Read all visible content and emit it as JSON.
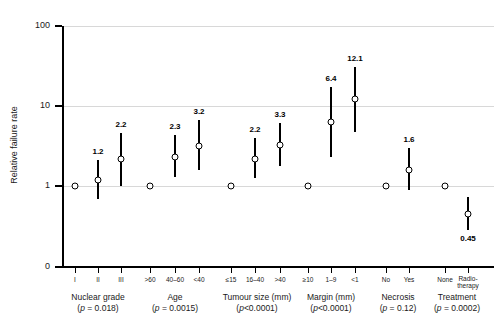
{
  "chart_data": {
    "type": "scatter",
    "title": "",
    "xlabel": "",
    "ylabel": "Relative failure rate",
    "yscale": "log",
    "ylim": [
      0,
      100
    ],
    "ytick_labels": [
      "100",
      "10",
      "1",
      "0"
    ],
    "ytick_values": [
      100,
      10,
      1,
      0
    ],
    "grid": true,
    "gridlines_at": [
      100,
      10,
      1
    ],
    "legend": "none",
    "annotation": "Reference categories plotted at relative failure rate 1.0 with no confidence interval.",
    "groups": [
      {
        "name": "Nuclear grade",
        "pvalue_text": "(p = 0.018)",
        "pvalue": 0.018,
        "points": [
          {
            "label": "I",
            "value": 1.0,
            "value_text": "",
            "ci_low": null,
            "ci_high": null,
            "reference": true
          },
          {
            "label": "II",
            "value": 1.2,
            "value_text": "1.2",
            "ci_low": 0.68,
            "ci_high": 2.1,
            "reference": false
          },
          {
            "label": "III",
            "value": 2.2,
            "value_text": "2.2",
            "ci_low": 1.0,
            "ci_high": 4.6,
            "reference": false
          }
        ]
      },
      {
        "name": "Age",
        "pvalue_text": "(p = 0.0015)",
        "pvalue": 0.0015,
        "points": [
          {
            "label": ">60",
            "value": 1.0,
            "value_text": "",
            "ci_low": null,
            "ci_high": null,
            "reference": true
          },
          {
            "label": "40–60",
            "value": 2.3,
            "value_text": "2.3",
            "ci_low": 1.3,
            "ci_high": 4.3,
            "reference": false
          },
          {
            "label": "<40",
            "value": 3.2,
            "value_text": "3.2",
            "ci_low": 1.6,
            "ci_high": 6.6,
            "reference": false
          }
        ]
      },
      {
        "name": "Tumour size (mm)",
        "pvalue_text": "(p<0.0001)",
        "pvalue": 0.0001,
        "points": [
          {
            "label": "≤15",
            "value": 1.0,
            "value_text": "",
            "ci_low": null,
            "ci_high": null,
            "reference": true
          },
          {
            "label": "16–40",
            "value": 2.2,
            "value_text": "2.2",
            "ci_low": 1.25,
            "ci_high": 4.0,
            "reference": false
          },
          {
            "label": ">40",
            "value": 3.3,
            "value_text": "3.3",
            "ci_low": 1.8,
            "ci_high": 6.2,
            "reference": false
          }
        ]
      },
      {
        "name": "Margin (mm)",
        "pvalue_text": "(p<0.0001)",
        "pvalue": 0.0001,
        "points": [
          {
            "label": "≥10",
            "value": 1.0,
            "value_text": "",
            "ci_low": null,
            "ci_high": null,
            "reference": true
          },
          {
            "label": "1–9",
            "value": 6.4,
            "value_text": "6.4",
            "ci_low": 2.3,
            "ci_high": 17.5,
            "reference": false
          },
          {
            "label": "<1",
            "value": 12.1,
            "value_text": "12.1",
            "ci_low": 4.7,
            "ci_high": 31.0,
            "reference": false
          }
        ]
      },
      {
        "name": "Necrosis",
        "pvalue_text": "(p = 0.12)",
        "pvalue": 0.12,
        "points": [
          {
            "label": "No",
            "value": 1.0,
            "value_text": "",
            "ci_low": null,
            "ci_high": null,
            "reference": true
          },
          {
            "label": "Yes",
            "value": 1.6,
            "value_text": "1.6",
            "ci_low": 0.9,
            "ci_high": 3.0,
            "reference": false
          }
        ]
      },
      {
        "name": "Treatment",
        "pvalue_text": "(p = 0.0002)",
        "pvalue": 0.0002,
        "points": [
          {
            "label": "None",
            "value": 1.0,
            "value_text": "",
            "ci_low": null,
            "ci_high": null,
            "reference": true
          },
          {
            "label": "Radio-\ntherapy",
            "value": 0.45,
            "value_text": "0.45",
            "ci_low": 0.28,
            "ci_high": 0.72,
            "reference": false
          }
        ]
      }
    ]
  },
  "colors": {
    "axis": "#000000",
    "marker_fill": "#ffffff",
    "marker_stroke": "#000000",
    "gridline": "#d8d8d8",
    "background": "#ffffff",
    "text": "#1a1a1a"
  }
}
